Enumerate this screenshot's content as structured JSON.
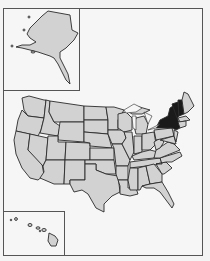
{
  "map": {
    "type": "US states outline map",
    "base_fill": "#d2d2d2",
    "highlight_fill": "#1a1a1a",
    "background": "#f6f6f6",
    "border_color": "#2a2a2a",
    "highlighted_states": [
      "New York",
      "Vermont",
      "New Hampshire"
    ],
    "insets": [
      {
        "name": "Alaska",
        "position": "top-left"
      },
      {
        "name": "Hawaii",
        "position": "bottom-left"
      }
    ]
  }
}
